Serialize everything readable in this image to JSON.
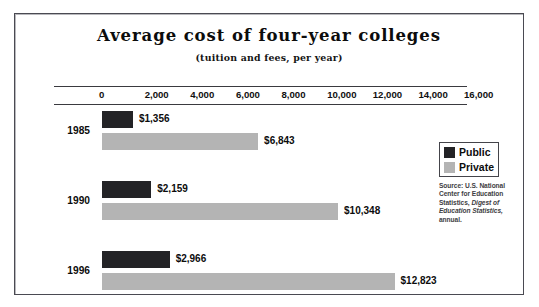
{
  "chart_data": {
    "type": "bar",
    "orientation": "horizontal",
    "title": "Average cost of four-year colleges",
    "subtitle": "(tuition and fees, per year)",
    "xlabel": "",
    "ylabel": "",
    "xlim": [
      0,
      16000
    ],
    "grid": false,
    "legend_position": "right",
    "categories": [
      "1985",
      "1990",
      "1996"
    ],
    "tick_labels": [
      "0",
      "2,000",
      "4,000",
      "6,000",
      "8,000",
      "10,000",
      "12,000",
      "14,000",
      "16,000"
    ],
    "tick_values": [
      0,
      2000,
      4000,
      6000,
      8000,
      10000,
      12000,
      14000,
      16000
    ],
    "series": [
      {
        "name": "Public",
        "color": "#232326",
        "values": [
          1356,
          2159,
          2966
        ],
        "value_labels": [
          "$1,356",
          "$2,159",
          "$2,966"
        ]
      },
      {
        "name": "Private",
        "color": "#b4b4b4",
        "values": [
          6843,
          10348,
          12823
        ],
        "value_labels": [
          "$6,843",
          "$10,348",
          "$12,823"
        ]
      }
    ],
    "source_note": "Source: U.S. National Center for Education Statistics, Digest of Education Statistics, annual."
  },
  "source": {
    "line1": "Source: U.S. National",
    "line2": "Center for Education",
    "line3_plain": "Statistics, ",
    "line3_italic": "Digest of",
    "line4_italic": "Education Statistics,",
    "line5": "annual."
  }
}
